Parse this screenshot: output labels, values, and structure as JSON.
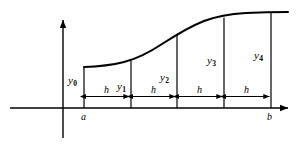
{
  "figure": {
    "stroke_color": "#000000",
    "background_color": "#ffffff",
    "curve_color": "#000000",
    "axis_color": "#000000"
  },
  "axes": {
    "x_axis_label": "",
    "y_axis_label": "",
    "origin_x": 63,
    "baseline_y": 108
  },
  "interval": {
    "start_label": "a",
    "end_label": "b",
    "strip_count": 4,
    "strip_width_label": "h"
  },
  "ordinates": [
    {
      "label": "y",
      "subscript": "0",
      "x": 84,
      "top_y": 67
    },
    {
      "label": "y",
      "subscript": "1",
      "x": 131,
      "top_y": 61
    },
    {
      "label": "y",
      "subscript": "2",
      "x": 177,
      "top_y": 45
    },
    {
      "label": "y",
      "subscript": "3",
      "x": 224,
      "top_y": 22
    },
    {
      "label": "y",
      "subscript": "4",
      "x": 271,
      "top_y": 13
    }
  ],
  "strip_labels": [
    {
      "label": "h",
      "x": 107
    },
    {
      "label": "h",
      "x": 154
    },
    {
      "label": "h",
      "x": 200
    },
    {
      "label": "h",
      "x": 247
    }
  ],
  "ordinate_labels": [
    {
      "text": "y",
      "sub": "0",
      "x": 68,
      "y": 75
    },
    {
      "text": "y",
      "sub": "1",
      "x": 117,
      "y": 81
    },
    {
      "text": "y",
      "sub": "2",
      "x": 160,
      "y": 72
    },
    {
      "text": "y",
      "sub": "3",
      "x": 207,
      "y": 55
    },
    {
      "text": "y",
      "sub": "4",
      "x": 254,
      "y": 50
    }
  ],
  "endpoint_labels": [
    {
      "text": "a",
      "x": 81,
      "y": 113
    },
    {
      "text": "b",
      "x": 268,
      "y": 113
    }
  ]
}
